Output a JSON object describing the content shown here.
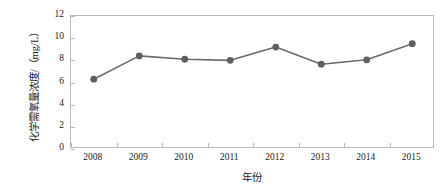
{
  "chart_data": {
    "type": "line",
    "title": "",
    "subtitle": "",
    "xlabel": "年份",
    "ylabel": "化学需氧量浓度/（mg/L）",
    "categories": [
      "2008",
      "2009",
      "2010",
      "2011",
      "2012",
      "2013",
      "2014",
      "2015"
    ],
    "x": [
      2008,
      2009,
      2010,
      2011,
      2012,
      2013,
      2014,
      2015
    ],
    "values": [
      6.3,
      8.4,
      8.1,
      8.0,
      9.2,
      7.65,
      8.05,
      9.5
    ],
    "series": [
      {
        "name": "化学需氧量浓度",
        "values": [
          6.3,
          8.4,
          8.1,
          8.0,
          9.2,
          7.65,
          8.05,
          9.5
        ]
      }
    ],
    "ylim": [
      0,
      12
    ],
    "yticks": [
      0,
      2,
      4,
      6,
      8,
      10,
      12
    ],
    "ytick_labels": [
      "0",
      "2",
      "4",
      "6",
      "8",
      "10",
      "12"
    ],
    "xtick_labels": [
      "2008",
      "2009",
      "2010",
      "2011",
      "2012",
      "2013",
      "2014",
      "2015"
    ],
    "grid": false,
    "legend": false,
    "legend_position": "none",
    "marker": "circle",
    "line_color": "#6b6b6b",
    "marker_color": "#5f5f5f",
    "axis_color": "#b9b9b9",
    "text_color": "#1a1a1a",
    "background_color": "#ffffff",
    "annotations": []
  }
}
